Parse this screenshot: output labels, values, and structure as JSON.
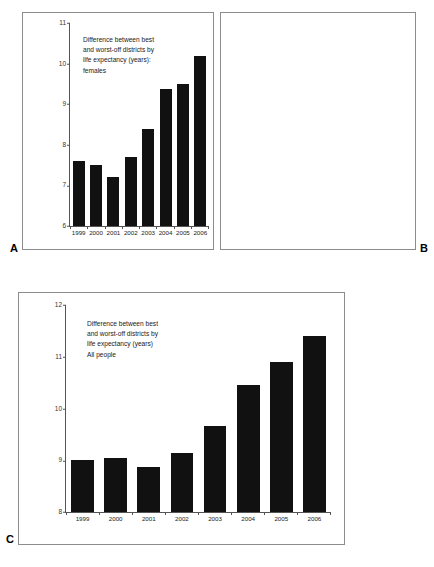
{
  "figure": {
    "background": "#ffffff",
    "bar_color": "#111111",
    "axis_color": "#555555",
    "frame_color": "#8c8c8c"
  },
  "panels": [
    {
      "letter": "A",
      "caption": "Difference between best\nand worst-off districts by\nlife expectancy (years):\nfemales",
      "ylabels": [
        "11",
        "10",
        "9",
        "8",
        "7",
        "6"
      ]
    },
    {
      "letter": "B",
      "caption": "Difference between best\nand worst-off districts by\nlife expectancy (years):\nmales",
      "ylabels": [
        "13",
        "12",
        "11",
        "10",
        "9",
        "8"
      ]
    },
    {
      "letter": "C",
      "caption": "Difference between best\nand worst-off districts by\nlife expectancy (years)\nAll people",
      "ylabels": [
        "12",
        "11",
        "10",
        "9",
        "8"
      ]
    }
  ],
  "chart_data": [
    {
      "type": "bar",
      "panel": "A",
      "title": "Difference between best and worst-off districts by life expectancy (years): females",
      "xlabel": "",
      "ylabel": "",
      "categories": [
        "1999",
        "2000",
        "2001",
        "2002",
        "2003",
        "2004",
        "2005",
        "2006"
      ],
      "values": [
        7.6,
        7.5,
        7.2,
        7.7,
        8.38,
        9.38,
        9.5,
        10.18
      ],
      "ylim": [
        6,
        11
      ],
      "yticks": [
        6,
        7,
        8,
        9,
        10,
        11
      ],
      "grid": false,
      "legend": "none"
    },
    {
      "type": "bar",
      "panel": "B",
      "title": "Difference between best and worst-off districts by life expectancy (years): males",
      "xlabel": "",
      "ylabel": "",
      "categories": [
        "1999",
        "2000",
        "2001",
        "2002",
        "2003",
        "2004",
        "2005",
        "2006"
      ],
      "values": [
        10.45,
        10.6,
        10.6,
        10.6,
        11.0,
        11.5,
        12.3,
        12.6
      ],
      "ylim": [
        8,
        13
      ],
      "yticks": [
        8,
        9,
        10,
        11,
        12,
        13
      ],
      "grid": false,
      "legend": "none"
    },
    {
      "type": "bar",
      "panel": "C",
      "title": "Difference between best and worst-off districts by life expectancy (years) All people",
      "xlabel": "",
      "ylabel": "",
      "categories": [
        "1999",
        "2000",
        "2001",
        "2002",
        "2003",
        "2004",
        "2005",
        "2006"
      ],
      "values": [
        9.0,
        9.05,
        8.87,
        9.15,
        9.67,
        10.45,
        10.9,
        11.4
      ],
      "ylim": [
        8,
        12
      ],
      "yticks": [
        8,
        9,
        10,
        11,
        12
      ],
      "grid": false,
      "legend": "none"
    }
  ]
}
